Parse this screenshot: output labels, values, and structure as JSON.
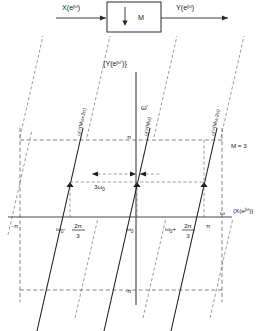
{
  "figure": {
    "title_plot": "{Y(e",
    "block_diagram": {
      "input_label_main": "X(e",
      "input_label_exp": "jω",
      "input_label_close": ")",
      "output_label_main": "Y(e",
      "output_label_exp": "jω",
      "output_label_close": ")",
      "block_label": "M",
      "downsample_arrow": "downward-arrow"
    },
    "plot": {
      "title_main": "{Y(e",
      "title_exp": "jω'",
      "title_close": ")}",
      "vertical_axis_label": "ω'",
      "horizontal_axis_label": "ω",
      "horizontal_axis_function": "{X(e",
      "horizontal_axis_function_exp": "jω",
      "horizontal_axis_function_close": ")}",
      "param_label": "M = 3",
      "span_label": "3ω",
      "span_label_sub": "0",
      "y_ticks": [
        {
          "name": "pi-positive",
          "label": "π"
        },
        {
          "name": "pi-negative",
          "label": "-π"
        }
      ],
      "x_ticks": [
        {
          "name": "minus-pi",
          "label": "-π",
          "type": "plain"
        },
        {
          "name": "omega0-minus-2pi-over-3",
          "base": "ω",
          "sub": "0",
          "op": "-",
          "num": "2π",
          "den": "3",
          "type": "fraction"
        },
        {
          "name": "omega0",
          "base": "ω",
          "sub": "0",
          "type": "sub"
        },
        {
          "name": "omega0-plus-2pi-over-3",
          "base": "ω",
          "sub": "0",
          "op": "+",
          "num": "2π",
          "den": "3",
          "type": "fraction"
        },
        {
          "name": "pi",
          "label": "π",
          "type": "plain"
        }
      ],
      "lines": [
        {
          "name": "line-left",
          "label": "ω'=(Mω+2π)"
        },
        {
          "name": "line-center",
          "label": "ω'=(Mω)"
        },
        {
          "name": "line-right",
          "label": "ω'=(Mω-2π)"
        }
      ]
    }
  },
  "colors": {
    "ink": "#1a1a1a",
    "axis": "#4a4a4a",
    "dash": "#5a5a5a",
    "background": "#ffffff"
  }
}
